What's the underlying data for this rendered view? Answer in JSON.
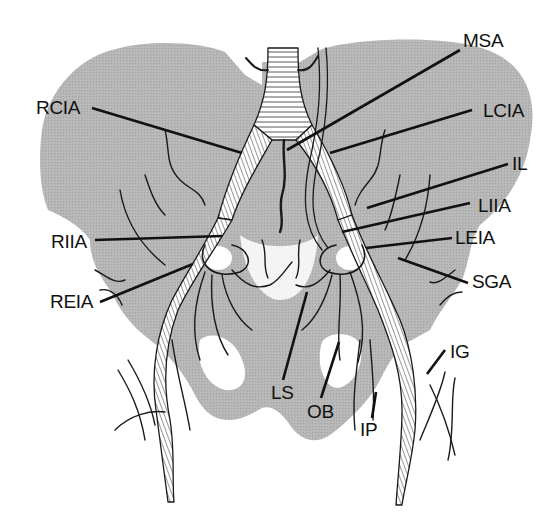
{
  "diagram": {
    "colors": {
      "background": "#ffffff",
      "pelvis_silhouette": "#b4b4b4",
      "vessel_fill": "#ffffff",
      "vessel_outline": "#1a1a1a",
      "leader_line": "#111111",
      "label_text": "#111111"
    },
    "labels": [
      {
        "id": "msa",
        "text": "MSA",
        "x": 463,
        "y": 31,
        "line": [
          460,
          50,
          287,
          150
        ]
      },
      {
        "id": "rcia",
        "text": "RCIA",
        "x": 36,
        "y": 98,
        "line": [
          92,
          108,
          242,
          153
        ]
      },
      {
        "id": "lcia",
        "text": "LCIA",
        "x": 483,
        "y": 101,
        "line": [
          472,
          110,
          330,
          153
        ]
      },
      {
        "id": "il",
        "text": "IL",
        "x": 512,
        "y": 154,
        "line": [
          508,
          164,
          367,
          208
        ]
      },
      {
        "id": "liia",
        "text": "LIIA",
        "x": 478,
        "y": 196,
        "line": [
          470,
          203,
          342,
          232
        ]
      },
      {
        "id": "leia",
        "text": "LEIA",
        "x": 455,
        "y": 228,
        "line": [
          452,
          238,
          366,
          248
        ]
      },
      {
        "id": "riia",
        "text": "RIIA",
        "x": 51,
        "y": 232,
        "line": [
          95,
          240,
          222,
          236
        ]
      },
      {
        "id": "sga",
        "text": "SGA",
        "x": 472,
        "y": 272,
        "line": [
          468,
          283,
          398,
          258
        ]
      },
      {
        "id": "reia",
        "text": "REIA",
        "x": 50,
        "y": 292,
        "line": [
          100,
          302,
          193,
          264
        ]
      },
      {
        "id": "ig",
        "text": "IG",
        "x": 450,
        "y": 342,
        "line": [
          445,
          350,
          427,
          374
        ]
      },
      {
        "id": "ls",
        "text": "LS",
        "x": 271,
        "y": 383,
        "line": [
          283,
          380,
          307,
          292
        ]
      },
      {
        "id": "ob",
        "text": "OB",
        "x": 307,
        "y": 402,
        "line": [
          321,
          398,
          339,
          342
        ]
      },
      {
        "id": "ip",
        "text": "IP",
        "x": 360,
        "y": 420,
        "line": [
          372,
          418,
          376,
          392
        ]
      }
    ]
  }
}
